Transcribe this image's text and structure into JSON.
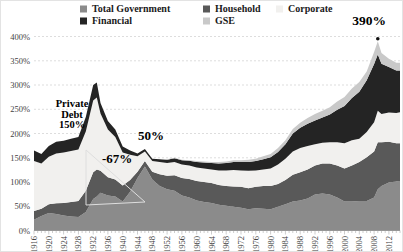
{
  "annotations": {
    "private_debt_lines": [
      "Private",
      "Debt",
      "150%"
    ],
    "decline": "-67%",
    "postwar_private": "50%",
    "peak": "390%"
  },
  "axes": {
    "y_labels": [
      "400%",
      "350%",
      "300%",
      "250%",
      "200%",
      "150%",
      "100%",
      "50%",
      "0%"
    ],
    "x_labels": [
      "1916",
      "1920",
      "1924",
      "1928",
      "1932",
      "1936",
      "1940",
      "1944",
      "1948",
      "1952",
      "1956",
      "1960",
      "1964",
      "1968",
      "1972",
      "1976",
      "1980",
      "1984",
      "1988",
      "1992",
      "1996",
      "2000",
      "2004",
      "2008",
      "2012"
    ]
  },
  "chart_data": {
    "type": "area",
    "stacked": true,
    "title": "",
    "xlabel": "",
    "ylabel": "",
    "yaxis_format": "percent",
    "ylim": [
      0,
      400
    ],
    "ytick_interval": 50,
    "x_range": [
      1916,
      2015
    ],
    "grid": "horizontal-dashed",
    "legend_position": "top",
    "x": [
      1916,
      1918,
      1920,
      1922,
      1924,
      1926,
      1928,
      1930,
      1932,
      1933,
      1934,
      1936,
      1938,
      1940,
      1942,
      1944,
      1946,
      1948,
      1950,
      1952,
      1954,
      1956,
      1958,
      1960,
      1962,
      1964,
      1966,
      1968,
      1970,
      1972,
      1974,
      1976,
      1978,
      1980,
      1982,
      1984,
      1986,
      1988,
      1990,
      1992,
      1994,
      1996,
      1998,
      2000,
      2002,
      2004,
      2006,
      2008,
      2009,
      2010,
      2012,
      2014,
      2015
    ],
    "series": [
      {
        "name": "Total Government",
        "color": "#8b8b8b",
        "values": [
          22,
          30,
          36,
          34,
          31,
          29,
          28,
          38,
          65,
          70,
          78,
          72,
          70,
          60,
          80,
          108,
          132,
          105,
          92,
          85,
          82,
          72,
          68,
          62,
          59,
          57,
          53,
          51,
          49,
          47,
          44,
          46,
          45,
          44,
          49,
          54,
          60,
          62,
          66,
          74,
          76,
          74,
          68,
          60,
          60,
          61,
          61,
          68,
          85,
          92,
          99,
          101,
          102
        ]
      },
      {
        "name": "Household",
        "color": "#595959",
        "values": [
          18,
          15,
          18,
          22,
          26,
          30,
          33,
          44,
          55,
          56,
          45,
          38,
          35,
          33,
          24,
          13,
          11,
          16,
          24,
          28,
          32,
          36,
          38,
          40,
          41,
          41,
          41,
          41,
          42,
          43,
          43,
          44,
          47,
          48,
          47,
          50,
          55,
          58,
          60,
          60,
          62,
          64,
          66,
          68,
          74,
          80,
          90,
          95,
          97,
          90,
          84,
          79,
          78
        ]
      },
      {
        "name": "Corporate",
        "color": "#f1f0ee",
        "values": [
          103,
          93,
          98,
          103,
          104,
          105,
          106,
          122,
          148,
          148,
          118,
          98,
          88,
          68,
          52,
          32,
          20,
          22,
          25,
          26,
          27,
          28,
          28,
          28,
          28,
          28,
          30,
          32,
          34,
          34,
          36,
          34,
          34,
          36,
          40,
          44,
          48,
          50,
          48,
          44,
          43,
          44,
          48,
          52,
          52,
          48,
          52,
          60,
          65,
          58,
          60,
          62,
          64
        ]
      },
      {
        "name": "Financial",
        "color": "#242424",
        "values": [
          22,
          20,
          22,
          24,
          24,
          25,
          26,
          30,
          32,
          31,
          22,
          18,
          15,
          12,
          9,
          6,
          5,
          5,
          6,
          7,
          8,
          9,
          10,
          11,
          12,
          13,
          14,
          15,
          16,
          17,
          18,
          19,
          21,
          23,
          26,
          30,
          37,
          42,
          46,
          49,
          52,
          57,
          67,
          77,
          87,
          97,
          107,
          120,
          116,
          104,
          94,
          88,
          86
        ]
      },
      {
        "name": "GSE",
        "color": "#c9c9c9",
        "values": [
          0,
          0,
          0,
          0,
          0,
          0,
          0,
          0,
          0,
          0,
          0,
          0,
          0,
          0,
          0,
          0,
          0,
          0,
          0,
          1,
          1,
          1,
          1,
          2,
          2,
          2,
          3,
          3,
          4,
          4,
          5,
          5,
          6,
          7,
          8,
          8,
          9,
          10,
          12,
          13,
          14,
          15,
          17,
          18,
          20,
          20,
          18,
          25,
          27,
          22,
          17,
          16,
          16
        ]
      }
    ],
    "peak_marker": {
      "year": 2009,
      "value": 390,
      "label": "390%"
    },
    "callout_wedge": {
      "from_year": 1930,
      "converge_year": 1946,
      "note": "private debt collapse 150% to 50%"
    }
  }
}
